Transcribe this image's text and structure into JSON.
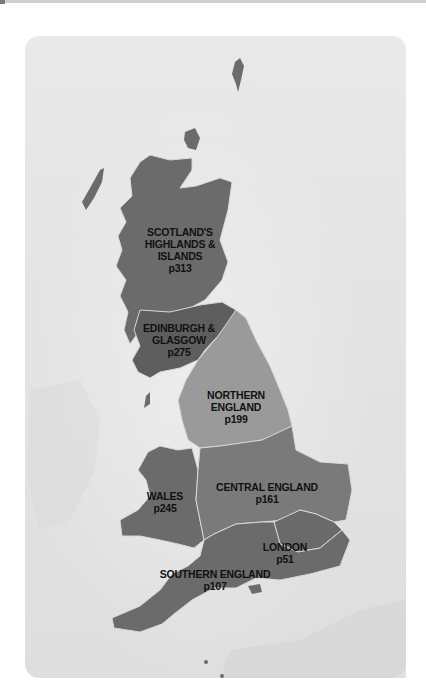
{
  "map": {
    "title": "",
    "colors": {
      "panel_bg": "#e6e6e6",
      "region_dark": "#6b6b6b",
      "region_mid": "#7a7a7a",
      "region_light": "#9a9a9a",
      "border": "#d8d8d8",
      "label_text": "#111111"
    },
    "regions": [
      {
        "id": "scotland-highlands",
        "name_lines": [
          "SCOTLAND'S",
          "HIGHLANDS &",
          "ISLANDS"
        ],
        "page": "p313"
      },
      {
        "id": "edinburgh-glasgow",
        "name_lines": [
          "EDINBURGH &",
          "GLASGOW"
        ],
        "page": "p275"
      },
      {
        "id": "northern-england",
        "name_lines": [
          "NORTHERN",
          "ENGLAND"
        ],
        "page": "p199"
      },
      {
        "id": "wales",
        "name_lines": [
          "WALES"
        ],
        "page": "p245"
      },
      {
        "id": "central-england",
        "name_lines": [
          "CENTRAL ENGLAND"
        ],
        "page": "p161"
      },
      {
        "id": "london",
        "name_lines": [
          "LONDON"
        ],
        "page": "p51"
      },
      {
        "id": "southern-england",
        "name_lines": [
          "SOUTHERN ENGLAND"
        ],
        "page": "p107"
      }
    ]
  }
}
